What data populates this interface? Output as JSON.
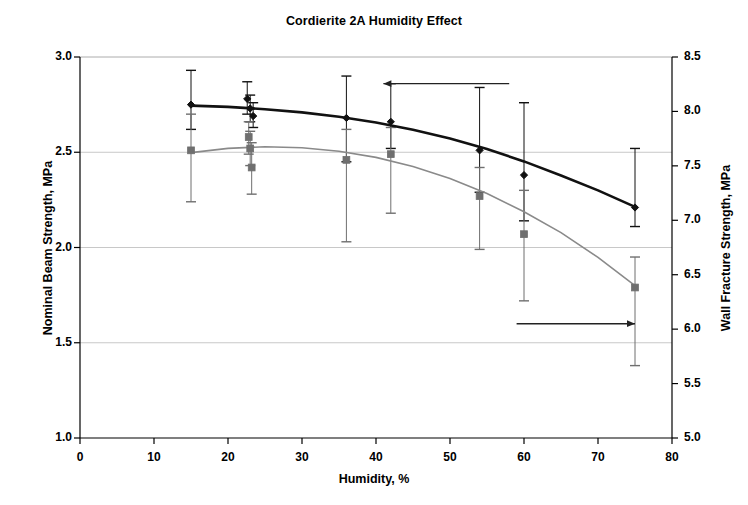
{
  "chart_data": {
    "type": "scatter",
    "title": "Cordierite 2A Humidity Effect",
    "xlabel": "Humidity, %",
    "ylabel": "Nominal Beam Strength, MPa",
    "ylabel_right": "Wall Fracture Strength, MPa",
    "xlim": [
      0,
      80
    ],
    "ylim": [
      1.0,
      3.0
    ],
    "ylim_right": [
      5.0,
      8.5
    ],
    "xticks": [
      0,
      10,
      20,
      30,
      40,
      50,
      60,
      70,
      80
    ],
    "xtick_labels": [
      "0",
      "10",
      "20",
      "30",
      "40",
      "50",
      "60",
      "70",
      "80"
    ],
    "yticks_left": [
      1.0,
      1.5,
      2.0,
      2.5,
      3.0
    ],
    "ytick_labels_left": [
      "1.0",
      "1.5",
      "2.0",
      "2.5",
      "3.0"
    ],
    "yticks_right": [
      5.0,
      5.5,
      6.0,
      6.5,
      7.0,
      7.5,
      8.0,
      8.5
    ],
    "ytick_labels_right": [
      "5.0",
      "5.5",
      "6.0",
      "6.5",
      "7.0",
      "7.5",
      "8.0",
      "8.5"
    ],
    "grid": "horizontal-major",
    "legend": "none",
    "annotations": [
      {
        "name": "left-arrow-to-primary-axis",
        "text": "",
        "direction": "left",
        "x_from": 58,
        "x_to": 41,
        "y": 2.86
      },
      {
        "name": "right-arrow-to-secondary-axis",
        "text": "",
        "direction": "right",
        "x_from": 59,
        "x_to": 75,
        "y": 1.6
      }
    ],
    "series": [
      {
        "name": "Nominal Beam Strength",
        "axis": "left",
        "marker": "diamond",
        "color": "#111111",
        "trend_color": "#111111",
        "points": [
          {
            "x": 15,
            "y": 2.75,
            "yerr_low": 2.62,
            "yerr_high": 2.93
          },
          {
            "x": 22.6,
            "y": 2.78,
            "yerr_low": 2.7,
            "yerr_high": 2.87
          },
          {
            "x": 23,
            "y": 2.73,
            "yerr_low": 2.66,
            "yerr_high": 2.8
          },
          {
            "x": 23.4,
            "y": 2.69,
            "yerr_low": 2.63,
            "yerr_high": 2.76
          },
          {
            "x": 36,
            "y": 2.68,
            "yerr_low": 2.45,
            "yerr_high": 2.9
          },
          {
            "x": 42,
            "y": 2.66,
            "yerr_low": 2.52,
            "yerr_high": 2.86
          },
          {
            "x": 54,
            "y": 2.51,
            "yerr_low": 2.29,
            "yerr_high": 2.84
          },
          {
            "x": 60,
            "y": 2.38,
            "yerr_low": 2.14,
            "yerr_high": 2.76
          },
          {
            "x": 75,
            "y": 2.21,
            "yerr_low": 2.11,
            "yerr_high": 2.52
          }
        ],
        "trend": [
          {
            "x": 15,
            "y": 2.745
          },
          {
            "x": 20,
            "y": 2.738
          },
          {
            "x": 25,
            "y": 2.726
          },
          {
            "x": 30,
            "y": 2.709
          },
          {
            "x": 35,
            "y": 2.686
          },
          {
            "x": 40,
            "y": 2.656
          },
          {
            "x": 45,
            "y": 2.618
          },
          {
            "x": 50,
            "y": 2.572
          },
          {
            "x": 55,
            "y": 2.517
          },
          {
            "x": 60,
            "y": 2.452
          },
          {
            "x": 65,
            "y": 2.378
          },
          {
            "x": 70,
            "y": 2.3
          },
          {
            "x": 75,
            "y": 2.213
          }
        ]
      },
      {
        "name": "Wall Fracture Strength",
        "axis": "right",
        "marker": "square",
        "color": "#6f6f6f",
        "trend_color": "#8a8a8a",
        "points": [
          {
            "x": 15,
            "y": 2.51,
            "yerr_low": 2.24,
            "yerr_high": 2.7
          },
          {
            "x": 22.8,
            "y": 2.58,
            "yerr_low": 2.49,
            "yerr_high": 2.66
          },
          {
            "x": 23,
            "y": 2.52,
            "yerr_low": 2.43,
            "yerr_high": 2.61
          },
          {
            "x": 23.2,
            "y": 2.42,
            "yerr_low": 2.28,
            "yerr_high": 2.55
          },
          {
            "x": 36,
            "y": 2.46,
            "yerr_low": 2.03,
            "yerr_high": 2.62
          },
          {
            "x": 42,
            "y": 2.49,
            "yerr_low": 2.18,
            "yerr_high": 2.63
          },
          {
            "x": 54,
            "y": 2.27,
            "yerr_low": 1.99,
            "yerr_high": 2.42
          },
          {
            "x": 60,
            "y": 2.07,
            "yerr_low": 1.72,
            "yerr_high": 2.3
          },
          {
            "x": 75,
            "y": 1.79,
            "yerr_low": 1.38,
            "yerr_high": 1.95
          }
        ],
        "trend": [
          {
            "x": 15,
            "y": 2.498
          },
          {
            "x": 20,
            "y": 2.52
          },
          {
            "x": 25,
            "y": 2.529
          },
          {
            "x": 30,
            "y": 2.524
          },
          {
            "x": 35,
            "y": 2.505
          },
          {
            "x": 40,
            "y": 2.473
          },
          {
            "x": 45,
            "y": 2.425
          },
          {
            "x": 50,
            "y": 2.362
          },
          {
            "x": 55,
            "y": 2.283
          },
          {
            "x": 60,
            "y": 2.188
          },
          {
            "x": 65,
            "y": 2.078
          },
          {
            "x": 70,
            "y": 1.948
          },
          {
            "x": 75,
            "y": 1.8
          }
        ]
      }
    ]
  },
  "figure": {
    "background_color": "#ffffff",
    "axis_color": "#000000",
    "grid_color": "#c8c8c8"
  }
}
